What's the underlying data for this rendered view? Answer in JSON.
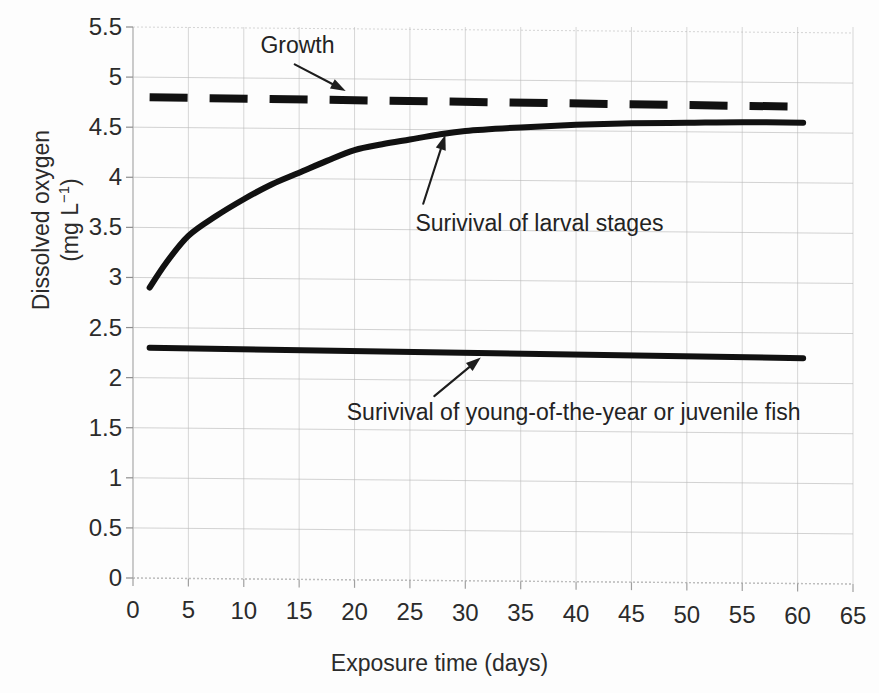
{
  "chart_data": {
    "type": "line",
    "title": "",
    "xlabel": "Exposure time (days)",
    "ylabel": "Dissolved oxygen (mg L-1)",
    "ylabel_main": "Dissolved oxygen",
    "ylabel_units": "(mg L",
    "ylabel_units_exp": "−1",
    "ylabel_units_close": ")",
    "xlim": [
      0,
      65
    ],
    "ylim": [
      0,
      5.5
    ],
    "xticks": [
      0,
      5,
      10,
      15,
      20,
      25,
      30,
      35,
      40,
      45,
      50,
      55,
      60,
      65
    ],
    "yticks": [
      0,
      0.5,
      1,
      1.5,
      2,
      2.5,
      3,
      3.5,
      4,
      4.5,
      5,
      5.5
    ],
    "xtick_labels": [
      "0",
      "5",
      "10",
      "15",
      "20",
      "25",
      "30",
      "35",
      "40",
      "45",
      "50",
      "55",
      "60",
      "65"
    ],
    "ytick_labels": [
      "0",
      "0.5",
      "1",
      "1.5",
      "2",
      "2.5",
      "3",
      "3.5",
      "4",
      "4.5",
      "5",
      "5.5"
    ],
    "grid": true,
    "legend": "none",
    "line_color": "#111111",
    "grid_color": "#b9b9b9",
    "series": [
      {
        "name": "Growth",
        "style": "dashed",
        "x": [
          1.5,
          60.5
        ],
        "values": [
          4.8,
          4.76
        ],
        "annotation": "Growth"
      },
      {
        "name": "Surivival of larval stages",
        "style": "solid",
        "x": [
          1.5,
          3,
          5,
          7.5,
          10,
          12.5,
          15,
          17.5,
          20,
          22.5,
          25,
          27.5,
          30,
          35,
          40,
          45,
          50,
          55,
          60.5
        ],
        "values": [
          2.9,
          3.15,
          3.42,
          3.62,
          3.79,
          3.94,
          4.06,
          4.18,
          4.29,
          4.35,
          4.4,
          4.45,
          4.49,
          4.53,
          4.56,
          4.58,
          4.59,
          4.6,
          4.6
        ],
        "annotation": "Surivival of larval stages"
      },
      {
        "name": "Surivival of young-of-the-year or juvenile fish",
        "style": "solid",
        "x": [
          1.5,
          60.5
        ],
        "values": [
          2.3,
          2.25
        ],
        "annotation": "Surivival of young-of-the-year or juvenile fish"
      }
    ],
    "annotations": [
      {
        "id": "growth",
        "text": "Growth",
        "text_x": 11.5,
        "text_y": 5.33,
        "arrow_from_x": 14.6,
        "arrow_from_y": 5.14,
        "arrow_to_x": 19.2,
        "arrow_to_y": 4.88
      },
      {
        "id": "larval",
        "text": "Surivival of larval stages",
        "text_x": 25.5,
        "text_y": 3.57,
        "arrow_from_x": 26.2,
        "arrow_from_y": 3.76,
        "arrow_to_x": 28.2,
        "arrow_to_y": 4.45
      },
      {
        "id": "juvenile",
        "text": "Surivival of young-of-the-year or juvenile fish",
        "text_x": 19.3,
        "text_y": 1.67,
        "arrow_from_x": 27.2,
        "arrow_from_y": 1.84,
        "arrow_to_x": 31.4,
        "arrow_to_y": 2.23
      }
    ]
  }
}
